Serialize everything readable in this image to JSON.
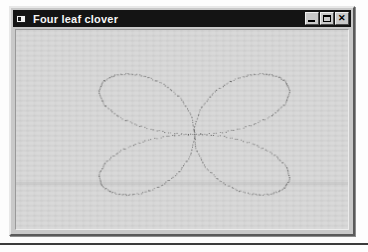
{
  "window": {
    "title": "Four leaf clover",
    "sysmenu_icon": "window-system-menu-icon",
    "controls": [
      {
        "name": "minimize",
        "label": "_",
        "glyph": "minimize-icon"
      },
      {
        "name": "maximize",
        "label": "□",
        "glyph": "maximize-icon"
      },
      {
        "name": "close",
        "label": "✕",
        "glyph": "close-icon"
      }
    ],
    "titlebar_color": "#141414",
    "titlebar_text_color": "#f4f4f4",
    "face_color": "#c9c9c9",
    "client_color": "#cfcfcf"
  },
  "chart_data": {
    "type": "line",
    "title": "Four leaf clover",
    "subtitle": "",
    "xlabel": "",
    "ylabel": "",
    "curve": "four-petal rose",
    "polar_equation": "r = a * cos(2*theta)",
    "amplitude_x": 124,
    "amplitude_y": 80,
    "petals": 4,
    "petal_angles_deg": [
      0,
      90,
      180,
      270
    ],
    "center": {
      "x": 179,
      "y": 106
    },
    "extents": {
      "left_x": 53,
      "right_x": 301,
      "top_y": 28,
      "bottom_y": 186
    },
    "line_color": "#3c3c3c",
    "line_style": "dotted",
    "line_width": 1,
    "grid": false,
    "axes_visible": false,
    "legend": "none",
    "background": "#cfcfcf",
    "samples": 720,
    "theta_range_deg": [
      0,
      360
    ]
  }
}
